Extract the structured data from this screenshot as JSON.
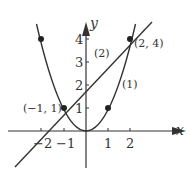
{
  "diagram": {
    "axes": {
      "x_label": "x",
      "y_label": "y",
      "x_ticks": [
        "−2",
        "−1",
        "1",
        "2"
      ],
      "y_ticks": [
        "1",
        "2",
        "3",
        "4"
      ]
    },
    "curves": [
      {
        "id": "1",
        "label": "(1)",
        "equation": "y = x^2",
        "type": "parabola"
      },
      {
        "id": "2",
        "label": "(2)",
        "equation": "y = x + 2",
        "type": "line"
      }
    ],
    "points": [
      {
        "label": "(−1, 1)",
        "x": -1,
        "y": 1
      },
      {
        "label": "(2, 4)",
        "x": 2,
        "y": 4
      },
      {
        "label": "",
        "x": 1,
        "y": 1
      },
      {
        "label": "",
        "x": -2,
        "y": 4
      }
    ],
    "colors": {
      "stroke": "#333333",
      "background": "#ffffff"
    }
  }
}
